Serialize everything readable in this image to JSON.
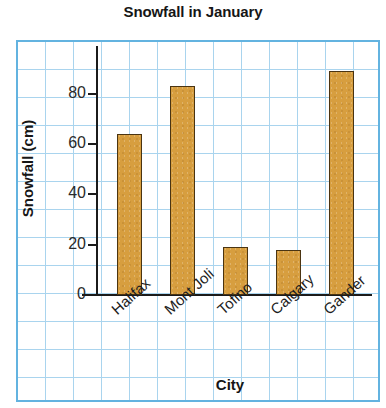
{
  "chart_data": {
    "type": "bar",
    "title": "Snowfall in January",
    "xlabel": "City",
    "ylabel": "Snowfall (cm)",
    "categories": [
      "Halifax",
      "Mont Joli",
      "Tofino",
      "Calgary",
      "Gander"
    ],
    "values": [
      64,
      83,
      19,
      18,
      89
    ],
    "ylim": [
      0,
      99
    ],
    "yticks": [
      0,
      20,
      40,
      60,
      80
    ],
    "ytick_labels": [
      "0",
      "20",
      "40",
      "60",
      "80"
    ],
    "grid": true,
    "grid_style": "graph-paper",
    "legend": null,
    "colors": {
      "bar_fill": "#d79e3f",
      "bar_border": "#4a3412",
      "grid_line": "#a9d4ee",
      "grid_frame": "#63b3e0",
      "axis": "#1b1b1b",
      "text": "#161616",
      "background": "#ffffff"
    }
  }
}
